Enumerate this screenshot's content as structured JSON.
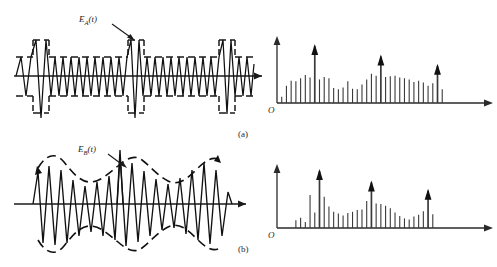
{
  "figure": {
    "title": "",
    "panels": [
      {
        "id": "a",
        "caption": "(a)",
        "waveform_label": "E",
        "waveform_label_sub": "A",
        "waveform_label_arg": "(t)",
        "spectrum_origin": "O"
      },
      {
        "id": "b",
        "caption": "(b)",
        "waveform_label": "E",
        "waveform_label_sub": "B",
        "waveform_label_arg": "(t)",
        "spectrum_origin": "O"
      }
    ]
  },
  "colors": {
    "ink": "#111111",
    "axis": "#2a2a2a",
    "spectrum_line": "#3a3a3a",
    "background": "#ffffff"
  },
  "chart_data": [
    {
      "type": "line",
      "name": "waveform-a",
      "title": "",
      "xlabel": "t",
      "ylabel": "",
      "series": [
        {
          "name": "E_A(t)",
          "description": "high-frequency carrier with rectangular (square) pulse envelope, three tall burst spikes",
          "envelope_type": "rectangular",
          "envelope_levels": [
            1.0,
            0.42
          ],
          "burst_positions": [
            0.18,
            0.62,
            0.93
          ],
          "n_cycles": 46
        }
      ],
      "grid": false,
      "legend": "none"
    },
    {
      "type": "line",
      "name": "spectrum-a",
      "title": "",
      "xlabel": "f",
      "ylabel": "",
      "origin_label": "O",
      "categories": [
        1,
        2,
        3,
        4,
        5,
        6,
        7,
        8,
        9,
        10,
        11,
        12,
        13,
        14,
        15,
        16,
        17,
        18,
        19,
        20,
        21,
        22,
        23,
        24,
        25,
        26,
        27,
        28,
        29,
        30,
        31,
        32,
        33,
        34,
        35,
        36,
        37,
        38,
        39,
        40,
        41,
        42
      ],
      "values": [
        0.1,
        0.28,
        0.36,
        0.35,
        0.4,
        0.45,
        0.41,
        0.92,
        0.38,
        0.42,
        0.4,
        0.24,
        0.22,
        0.25,
        0.35,
        0.23,
        0.22,
        0.3,
        0.38,
        0.47,
        0.44,
        0.75,
        0.42,
        0.43,
        0.44,
        0.41,
        0.4,
        0.38,
        0.34,
        0.36,
        0.33,
        0.28,
        0.32,
        0.6,
        0.22,
        0.0,
        0.0,
        0.0,
        0.0,
        0.0,
        0.0,
        0.0
      ],
      "arrow_indices": [
        7,
        21,
        33
      ],
      "axis_arrow_x": true,
      "axis_arrow_y": true,
      "grid": false,
      "legend": "none"
    },
    {
      "type": "line",
      "name": "waveform-b",
      "title": "",
      "xlabel": "t",
      "ylabel": "",
      "series": [
        {
          "name": "E_B(t)",
          "description": "high-frequency carrier with smooth sinusoidally-varying (dashed) envelope, one tall central spike",
          "envelope_type": "sinusoidal",
          "envelope_levels": [
            1.0,
            0.55
          ],
          "burst_positions": [
            0.47
          ],
          "n_cycles": 24
        }
      ],
      "grid": false,
      "legend": "none"
    },
    {
      "type": "line",
      "name": "spectrum-b",
      "title": "",
      "xlabel": "f",
      "ylabel": "",
      "origin_label": "O",
      "categories": [
        1,
        2,
        3,
        4,
        5,
        6,
        7,
        8,
        9,
        10,
        11,
        12,
        13,
        14,
        15,
        16,
        17,
        18,
        19,
        20,
        21,
        22,
        23,
        24,
        25,
        26,
        27,
        28,
        29,
        30,
        31,
        32,
        33,
        34,
        35,
        36,
        37,
        38,
        39,
        40,
        41,
        42
      ],
      "values": [
        0.0,
        0.0,
        0.0,
        0.13,
        0.17,
        0.1,
        0.55,
        0.26,
        0.95,
        0.52,
        0.36,
        0.27,
        0.24,
        0.21,
        0.25,
        0.27,
        0.3,
        0.31,
        0.45,
        0.76,
        0.41,
        0.4,
        0.37,
        0.33,
        0.26,
        0.2,
        0.16,
        0.14,
        0.19,
        0.22,
        0.28,
        0.62,
        0.23,
        0.0,
        0.0,
        0.0,
        0.0,
        0.0,
        0.0,
        0.0,
        0.0,
        0.0
      ],
      "arrow_indices": [
        8,
        19,
        31
      ],
      "axis_arrow_x": true,
      "axis_arrow_y": true,
      "grid": false,
      "legend": "none"
    }
  ]
}
